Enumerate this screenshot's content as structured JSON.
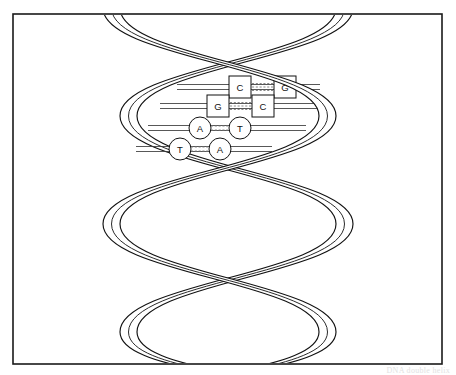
{
  "figure": {
    "caption": "DNA double helix",
    "background_color": "#ffffff",
    "line_color": "#111111",
    "frame": {
      "name": "image-border",
      "x": 13,
      "y": 14,
      "width": 429,
      "height": 350,
      "stroke_color": "#1a1a1a"
    }
  },
  "helix": {
    "strand_count": 2,
    "strand_a_name": "Strand A",
    "strand_b_name": "Strand B",
    "ribbon_fill": "#ffffff",
    "ribbon_stroke": "#111111",
    "turns": 2.5,
    "axis_x": 228,
    "radius": 108,
    "ribbon_width": 17,
    "top_y": 8,
    "bottom_y": 364
  },
  "base_pairs": [
    {
      "index": 0,
      "left_base": "C",
      "right_base": "G",
      "shape": "square",
      "bond_count": 3,
      "y": 87,
      "left_x": 240,
      "right_x": 285,
      "rail_left_x": 177,
      "rail_right_x": 320
    },
    {
      "index": 1,
      "left_base": "G",
      "right_base": "C",
      "shape": "square",
      "bond_count": 3,
      "y": 106,
      "left_x": 218,
      "right_x": 263,
      "rail_left_x": 160,
      "rail_right_x": 318
    },
    {
      "index": 2,
      "left_base": "A",
      "right_base": "T",
      "shape": "circle",
      "bond_count": 2,
      "y": 128,
      "left_x": 200,
      "right_x": 240,
      "rail_left_x": 148,
      "rail_right_x": 306
    },
    {
      "index": 3,
      "left_base": "T",
      "right_base": "A",
      "shape": "circle",
      "bond_count": 2,
      "y": 149,
      "left_x": 180,
      "right_x": 220,
      "rail_left_x": 136,
      "rail_right_x": 272
    }
  ],
  "legend": {
    "purine_shape_label": "circle",
    "pyrimidine_shape_label": "square",
    "hydrogen_bond_label": "hydrogen bonds"
  }
}
